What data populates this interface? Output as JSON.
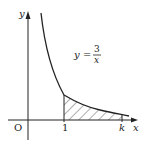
{
  "diagram": {
    "type": "function-graph",
    "function_label": {
      "lhs": "y",
      "eq": "=",
      "numerator": "3",
      "denominator": "x"
    },
    "axes": {
      "x_label": "x",
      "y_label": "y",
      "origin_label": "O"
    },
    "ticks": {
      "one": "1",
      "k": "k"
    },
    "shaded_region": "area under y = 3/x from x = 1 to x = k (hatched)",
    "colors": {
      "ink": "#222222",
      "background": "#ffffff"
    }
  }
}
